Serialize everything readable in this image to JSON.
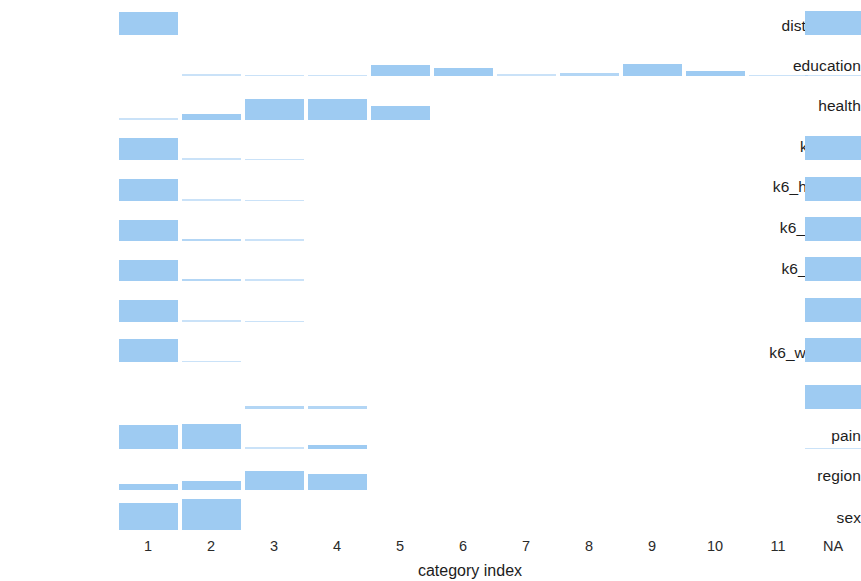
{
  "figure": {
    "bar_color": "#9ecbf2",
    "background": "#ffffff",
    "text_color": "#1c1c1c"
  },
  "axis": {
    "x_title": "category index",
    "tick_labels": [
      "1",
      "2",
      "3",
      "4",
      "5",
      "6",
      "7",
      "8",
      "9",
      "10",
      "11",
      "NA"
    ]
  },
  "rows": [
    {
      "label": "distress_k6"
    },
    {
      "label": "education"
    },
    {
      "label": "health"
    },
    {
      "label": "k6_effort"
    },
    {
      "label": "k6_hopeless"
    },
    {
      "label": "k6_nervous"
    },
    {
      "label": "k6_restless"
    },
    {
      "label": "k6_sad"
    },
    {
      "label": "k6_worthless"
    },
    {
      "label": "lifesat4"
    },
    {
      "label": "pain"
    },
    {
      "label": "region"
    },
    {
      "label": "sex"
    }
  ],
  "chart_data": {
    "type": "bar",
    "title": "",
    "xlabel": "category index",
    "ylabel": "",
    "grid": false,
    "legend": "none",
    "orientation": "vertical",
    "layout": "faceted-rows",
    "note": "One horizontal band per variable; bar height encodes the proportion of observations in each category index. 'NA' is the missing-value column.",
    "categories": [
      "1",
      "2",
      "3",
      "4",
      "5",
      "6",
      "7",
      "8",
      "9",
      "10",
      "11",
      "NA"
    ],
    "ylim": [
      0,
      1
    ],
    "series": [
      {
        "name": "distress_k6",
        "values": [
          0.68,
          0,
          0,
          0,
          0,
          0,
          0,
          0,
          0,
          0,
          0,
          0.72
        ]
      },
      {
        "name": "education",
        "values": [
          0,
          0.06,
          0.03,
          0.03,
          0.33,
          0.24,
          0.05,
          0.09,
          0.36,
          0.15,
          0.03,
          0.02
        ]
      },
      {
        "name": "health",
        "values": [
          0.05,
          0.17,
          0.62,
          0.62,
          0.4,
          0,
          0,
          0,
          0,
          0,
          0,
          0
        ]
      },
      {
        "name": "k6_effort",
        "values": [
          0.66,
          0.05,
          0.04,
          0,
          0,
          0,
          0,
          0,
          0,
          0,
          0,
          0.72
        ]
      },
      {
        "name": "k6_hopeless",
        "values": [
          0.66,
          0.05,
          0.02,
          0,
          0,
          0,
          0,
          0,
          0,
          0,
          0,
          0.72
        ]
      },
      {
        "name": "k6_nervous",
        "values": [
          0.62,
          0.07,
          0.05,
          0,
          0,
          0,
          0,
          0,
          0,
          0,
          0,
          0.72
        ]
      },
      {
        "name": "k6_restless",
        "values": [
          0.62,
          0.07,
          0.05,
          0,
          0,
          0,
          0,
          0,
          0,
          0,
          0,
          0.72
        ]
      },
      {
        "name": "k6_sad",
        "values": [
          0.64,
          0.06,
          0.03,
          0,
          0,
          0,
          0,
          0,
          0,
          0,
          0,
          0.72
        ]
      },
      {
        "name": "k6_worthless",
        "values": [
          0.68,
          0.04,
          0,
          0,
          0,
          0,
          0,
          0,
          0,
          0,
          0,
          0.72
        ]
      },
      {
        "name": "lifesat4",
        "values": [
          0,
          0,
          0.1,
          0.1,
          0,
          0,
          0,
          0,
          0,
          0,
          0,
          0.72
        ]
      },
      {
        "name": "pain",
        "values": [
          0.7,
          0.74,
          0.06,
          0.13,
          0,
          0,
          0,
          0,
          0,
          0,
          0,
          0.02
        ]
      },
      {
        "name": "region",
        "values": [
          0.18,
          0.26,
          0.56,
          0.46,
          0,
          0,
          0,
          0,
          0,
          0,
          0,
          0
        ]
      },
      {
        "name": "sex",
        "values": [
          0.8,
          0.92,
          0,
          0,
          0,
          0,
          0,
          0,
          0,
          0,
          0,
          0
        ]
      }
    ]
  },
  "geometry": {
    "tick_x": [
      148,
      211,
      274,
      337,
      400,
      463,
      526,
      589,
      652,
      715,
      778,
      833
    ],
    "bar_width": 59,
    "na_bar_width": 56,
    "row_baselines": [
      35,
      76,
      120,
      160,
      201,
      241,
      281,
      322,
      362,
      409,
      449,
      490,
      530
    ],
    "row_label_y": [
      18,
      58,
      98,
      139,
      179,
      220,
      261,
      304,
      345,
      386,
      428,
      468,
      510
    ],
    "max_bar_px": 34,
    "tick_label_y": 539,
    "axis_title_x": 470,
    "axis_title_y": 563
  }
}
